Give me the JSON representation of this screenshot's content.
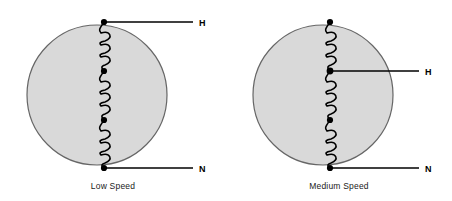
{
  "figure": {
    "title": "",
    "background_color": "#ffffff",
    "stator_fill": "#d9d9d9",
    "stator_stroke": "#555555",
    "wire_color": "#000000"
  },
  "diagrams": [
    {
      "id": "low-speed",
      "caption": "Low Speed",
      "stator": {
        "cx": 97,
        "cy": 95,
        "r": 70
      },
      "coil_groups": 3,
      "loops_per_group": 3,
      "terminals": [
        {
          "name": "H",
          "label": "H",
          "tap_index": 0,
          "y": 22,
          "line_x_start": 104,
          "line_x_end": 193,
          "label_x": 199
        },
        {
          "name": "N",
          "label": "N",
          "tap_index": 3,
          "y": 168,
          "line_x_start": 104,
          "line_x_end": 193,
          "label_x": 199
        }
      ],
      "junction_dots": [
        {
          "x": 104,
          "y": 22
        },
        {
          "x": 104,
          "y": 71
        },
        {
          "x": 104,
          "y": 120
        },
        {
          "x": 104,
          "y": 168
        }
      ]
    },
    {
      "id": "medium-speed",
      "caption": "Medium Speed",
      "stator": {
        "cx": 97,
        "cy": 95,
        "r": 70
      },
      "coil_groups": 3,
      "loops_per_group": 3,
      "terminals": [
        {
          "name": "H",
          "label": "H",
          "tap_index": 1,
          "y": 71,
          "line_x_start": 104,
          "line_x_end": 193,
          "label_x": 199
        },
        {
          "name": "N",
          "label": "N",
          "tap_index": 3,
          "y": 168,
          "line_x_start": 104,
          "line_x_end": 193,
          "label_x": 199
        }
      ],
      "junction_dots": [
        {
          "x": 104,
          "y": 22
        },
        {
          "x": 104,
          "y": 71
        },
        {
          "x": 104,
          "y": 120
        },
        {
          "x": 104,
          "y": 168
        }
      ]
    }
  ],
  "labels": {
    "hot_terminal": "H",
    "neutral_terminal": "N",
    "caption_low": "Low Speed",
    "caption_medium": "Medium Speed"
  }
}
